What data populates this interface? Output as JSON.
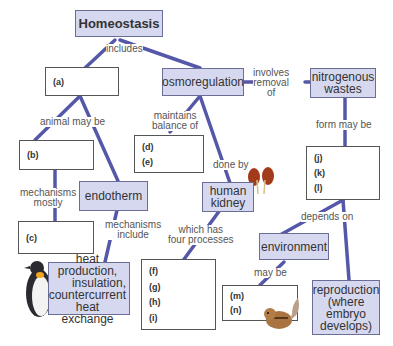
{
  "diagram": {
    "title": "Homeostasis",
    "concepts": {
      "osmoregulation": "osmoregulation",
      "nitrogenous_wastes_1": "nitrogenous",
      "nitrogenous_wastes_2": "wastes",
      "endotherm": "endotherm",
      "human_kidney_1": "human",
      "human_kidney_2": "kidney",
      "environment": "environment",
      "heat_1": "heat production,",
      "heat_2": "insulation,",
      "heat_3": "countercurrent",
      "heat_4": "heat exchange",
      "reproduction_1": "reproduction",
      "reproduction_2": "(where",
      "reproduction_3": "embryo",
      "reproduction_4": "develops)"
    },
    "blanks": {
      "a": "(a)",
      "b": "(b)",
      "c": "(c)",
      "d": "(d)",
      "e": "(e)",
      "f": "(f)",
      "g": "(g)",
      "h": "(h)",
      "i": "(i)",
      "j": "(j)",
      "k": "(k)",
      "l": "(l)",
      "m": "(m)",
      "n": "(n)"
    },
    "links": {
      "includes": "includes",
      "involves_1": "involves",
      "involves_2": "removal",
      "involves_3": "of",
      "animal_may_be": "animal may be",
      "maintains_1": "maintains",
      "maintains_2": "balance of",
      "form_may_be": "form may be",
      "mech_mostly_1": "mechanisms",
      "mech_mostly_2": "mostly",
      "done_by": "done by",
      "mech_include_1": "mechanisms",
      "mech_include_2": "include",
      "which_has_1": "which has",
      "which_has_2": "four processes",
      "depends_on": "depends on",
      "may_be": "may be"
    },
    "colors": {
      "concept_fill": "#d6d8ef",
      "line": "#5558a8",
      "text": "#333333"
    }
  }
}
